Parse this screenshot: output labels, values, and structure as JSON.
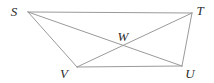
{
  "figure": {
    "type": "geometry-diagram",
    "shape_name": "quadrilateral STUV with diagonals",
    "canvas": {
      "width": 214,
      "height": 83,
      "background": "#ffffff"
    },
    "style": {
      "line_color": "#9a9a9a",
      "line_width": 1,
      "label_color": "#2b2b2b",
      "label_font_size": 13,
      "label_font_style": "italic"
    },
    "points": [
      {
        "id": "S",
        "label": "S",
        "x": 28,
        "y": 12,
        "label_x": 14,
        "label_y": 11
      },
      {
        "id": "T",
        "label": "T",
        "x": 192,
        "y": 13,
        "label_x": 200,
        "label_y": 10
      },
      {
        "id": "U",
        "label": "U",
        "x": 182,
        "y": 66,
        "label_x": 190,
        "label_y": 73
      },
      {
        "id": "V",
        "label": "V",
        "x": 77,
        "y": 67,
        "label_x": 64,
        "label_y": 73
      },
      {
        "id": "W",
        "label": "W",
        "x": 124,
        "y": 46,
        "label_x": 123,
        "label_y": 36
      }
    ],
    "segments": [
      {
        "id": "ST",
        "from": "S",
        "to": "T",
        "role": "side-top"
      },
      {
        "id": "VU",
        "from": "V",
        "to": "U",
        "role": "side-bottom"
      },
      {
        "id": "SV",
        "from": "S",
        "to": "V",
        "role": "side-left"
      },
      {
        "id": "TU",
        "from": "T",
        "to": "U",
        "role": "side-right"
      },
      {
        "id": "SU",
        "from": "S",
        "to": "U",
        "role": "diagonal"
      },
      {
        "id": "TV",
        "from": "T",
        "to": "V",
        "role": "diagonal"
      }
    ],
    "intersections": [
      {
        "id": "W",
        "of": [
          "SU",
          "TV"
        ],
        "x": 124,
        "y": 46
      }
    ]
  }
}
